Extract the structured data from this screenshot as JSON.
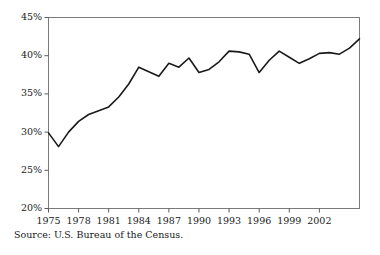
{
  "figure": {
    "source_note": "Source: U.S. Bureau of the Census.",
    "background_color": "#ffffff",
    "frame_color": "#7a7a7a",
    "line_color": "#1a1a1a"
  },
  "chart_data": {
    "type": "line",
    "title": "",
    "subtitle": "",
    "xlabel": "",
    "ylabel": "",
    "xlim": [
      1975,
      2006
    ],
    "ylim": [
      20,
      45
    ],
    "grid": false,
    "legend": "none",
    "y_tick_labels": [
      "45%",
      "40%",
      "35%",
      "30%",
      "25%",
      "20%"
    ],
    "y_tick_values": [
      45,
      40,
      35,
      30,
      25,
      20
    ],
    "x_tick_labels": [
      "1975",
      "1978",
      "1981",
      "1984",
      "1987",
      "1990",
      "1993",
      "1996",
      "1999",
      "2002"
    ],
    "x_tick_values": [
      1975,
      1978,
      1981,
      1984,
      1987,
      1990,
      1993,
      1996,
      1999,
      2002
    ],
    "x": [
      1975,
      1976,
      1977,
      1978,
      1979,
      1980,
      1981,
      1982,
      1983,
      1984,
      1985,
      1986,
      1987,
      1988,
      1989,
      1990,
      1991,
      1992,
      1993,
      1994,
      1995,
      1996,
      1997,
      1998,
      1999,
      2000,
      2001,
      2002,
      2003,
      2004,
      2005,
      2006
    ],
    "series": [
      {
        "name": "Percent",
        "units": "%",
        "values": [
          29.9,
          28.1,
          30.0,
          31.4,
          32.3,
          32.8,
          33.3,
          34.6,
          36.3,
          38.5,
          37.9,
          37.3,
          39.0,
          38.5,
          39.7,
          37.8,
          38.2,
          39.2,
          40.6,
          40.5,
          40.2,
          37.8,
          39.4,
          40.6,
          39.8,
          39.0,
          39.6,
          40.3,
          40.4,
          40.2,
          41.0,
          42.2
        ]
      }
    ]
  }
}
